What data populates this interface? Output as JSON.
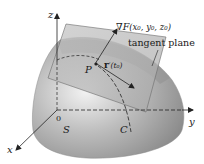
{
  "figure": {
    "type": "3d-surface-tangent-plane",
    "labels": {
      "z_axis": "z",
      "y_axis": "y",
      "x_axis": "x",
      "origin": "0",
      "gradient": "∇F(x₀, y₀, z₀)",
      "gradient_nabla": "∇",
      "gradient_F": "F",
      "gradient_args": "(x₀, y₀, z₀)",
      "tangent_plane": "tangent plane",
      "point": "P",
      "tangent_vector": "r′(t₀)",
      "tangent_vector_r": "r",
      "tangent_vector_rest": "′(t₀)",
      "surface": "S",
      "curve": "C"
    },
    "colors": {
      "surface_light": "#e6e6e6",
      "surface_mid": "#a9a9a9",
      "surface_dark": "#7a7a7a",
      "plane_fill": "#b8b8b8",
      "plane_edge": "#6b6b6b",
      "axis": "#222222",
      "background": "#ffffff"
    }
  }
}
